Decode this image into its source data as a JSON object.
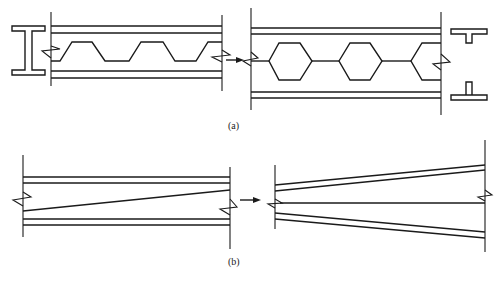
{
  "figure": {
    "panels": [
      {
        "id": "a",
        "label": "(a)",
        "description": "Castellated beam fabrication: I-section web cut along trapezoidal zigzag line, halves shifted and re-welded to form hexagonal openings; resulting tee sections shown at right",
        "left": {
          "name": "original I-beam with zigzag cut line",
          "cross_section": "I-section",
          "cut_pattern": "trapezoidal zigzag"
        },
        "right": {
          "name": "castellated beam with hexagonal web openings",
          "openings": "hexagon",
          "hexagon_count_full": 2,
          "cross_sections": [
            "tee-top",
            "tee-bottom (inverted)"
          ]
        },
        "arrow": "left-to-right"
      },
      {
        "id": "b",
        "label": "(b)",
        "description": "Tapered beam fabrication: I-beam web cut along diagonal line, one half flipped and re-welded to form a tapered member",
        "left": {
          "name": "original I-beam with diagonal cut line",
          "cut_pattern": "diagonal"
        },
        "right": {
          "name": "tapered beam",
          "shape": "flanges diverging to the right"
        },
        "arrow": "left-to-right"
      }
    ]
  }
}
